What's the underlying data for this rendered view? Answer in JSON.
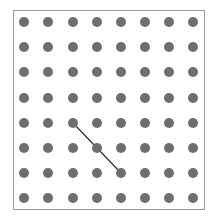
{
  "game": {
    "type": "dot-grid",
    "rows": 8,
    "cols": 8,
    "dot_color": "#6e6e6e",
    "line_color": "#333333",
    "border_color": "#9a9a9a",
    "col_x": [
      24,
      48,
      73,
      97,
      121,
      145,
      169,
      193
    ],
    "row_y": [
      22,
      47,
      72,
      98,
      123,
      148,
      173,
      198
    ],
    "lines": [
      {
        "from": {
          "row": 4,
          "col": 2
        },
        "to": {
          "row": 6,
          "col": 4
        }
      }
    ]
  }
}
